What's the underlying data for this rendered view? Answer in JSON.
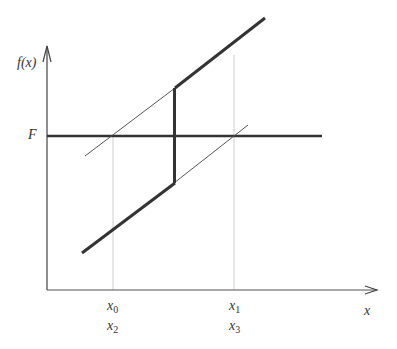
{
  "diagram": {
    "y_axis_label": "f(x)",
    "x_axis_label": "x",
    "level_label": "F",
    "x_ticks": [
      {
        "top": "x",
        "top_sub": "0",
        "bottom": "x",
        "bottom_sub": "2"
      },
      {
        "top": "x",
        "top_sub": "1",
        "bottom": "x",
        "bottom_sub": "3"
      }
    ],
    "colors": {
      "thick": "#333333",
      "thin": "#555555",
      "guide": "#cccccc",
      "axis": "#444444"
    }
  }
}
